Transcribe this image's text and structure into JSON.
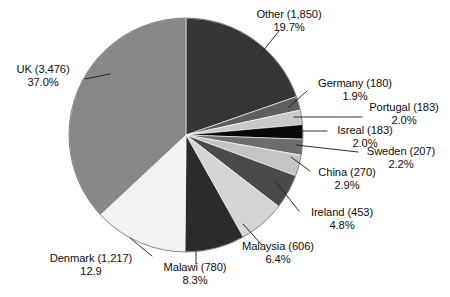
{
  "chart_data": {
    "type": "pie",
    "title": "",
    "xlabel": "",
    "ylabel": "",
    "legend_position": "none",
    "grid": false,
    "start_angle_deg": 0,
    "direction": "clockwise",
    "categories": [
      "Other",
      "Germany",
      "Portugal",
      "Isreal",
      "Sweden",
      "China",
      "Ireland",
      "Malaysia",
      "Malawi",
      "Denmark",
      "UK"
    ],
    "values": [
      1850,
      180,
      183,
      183,
      207,
      270,
      453,
      606,
      780,
      1217,
      3476
    ],
    "percents": [
      19.7,
      1.9,
      2.0,
      2.0,
      2.2,
      2.9,
      4.8,
      6.4,
      8.3,
      12.9,
      37.0
    ],
    "slices": [
      {
        "name": "Other",
        "value": 1850,
        "percent": 19.7,
        "color": "#363636",
        "label_line1": "Other (1,850)",
        "label_line2": "19.7%"
      },
      {
        "name": "Germany",
        "value": 180,
        "percent": 1.9,
        "color": "#5e5e5e",
        "label_line1": "Germany (180)",
        "label_line2": "1.9%"
      },
      {
        "name": "Portugal",
        "value": 183,
        "percent": 2.0,
        "color": "#c9c9c9",
        "label_line1": "Portugal (183)",
        "label_line2": "2.0%"
      },
      {
        "name": "Isreal",
        "value": 183,
        "percent": 2.0,
        "color": "#080808",
        "label_line1": "Isreal (183)",
        "label_line2": "2.0%"
      },
      {
        "name": "Sweden",
        "value": 207,
        "percent": 2.2,
        "color": "#6d6d6d",
        "label_line1": "Sweden (207)",
        "label_line2": "2.2%"
      },
      {
        "name": "China",
        "value": 270,
        "percent": 2.9,
        "color": "#c4c4c4",
        "label_line1": "China (270)",
        "label_line2": "2.9%"
      },
      {
        "name": "Ireland",
        "value": 453,
        "percent": 4.8,
        "color": "#4a4a4a",
        "label_line1": "Ireland (453)",
        "label_line2": "4.8%"
      },
      {
        "name": "Malaysia",
        "value": 606,
        "percent": 6.4,
        "color": "#d5d5d5",
        "label_line1": "Malaysia (606)",
        "label_line2": "6.4%"
      },
      {
        "name": "Malawi",
        "value": 780,
        "percent": 8.3,
        "color": "#2b2b2b",
        "label_line1": "Malawi (780)",
        "label_line2": "8.3%"
      },
      {
        "name": "Denmark",
        "value": 1217,
        "percent": 12.9,
        "color": "#f2f2f2",
        "label_line1": "Denmark (1,217)",
        "label_line2": "12.9"
      },
      {
        "name": "UK",
        "value": 3476,
        "percent": 37.0,
        "color": "#878787",
        "label_line1": "UK (3,476)",
        "label_line2": "37.0%"
      }
    ]
  }
}
